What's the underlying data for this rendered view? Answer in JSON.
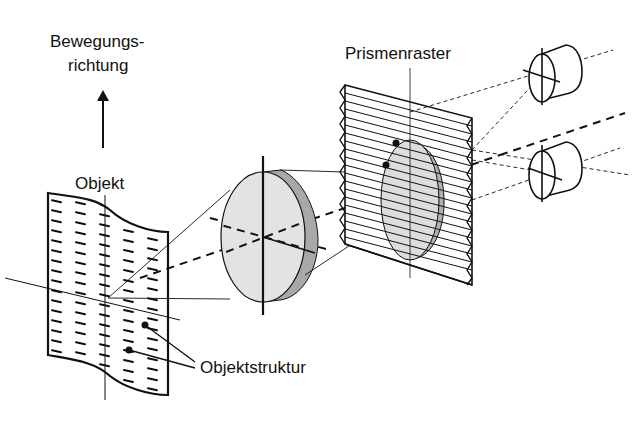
{
  "labels": {
    "direction_line1": "Bewegungs-",
    "direction_line2": "richtung",
    "object": "Objekt",
    "prism": "Prismenraster",
    "structure": "Objektstruktur"
  },
  "colors": {
    "line": "#111111",
    "lens_face": "#e3e3e3",
    "lens_edge": "#a8a8a8",
    "background": "#ffffff"
  }
}
